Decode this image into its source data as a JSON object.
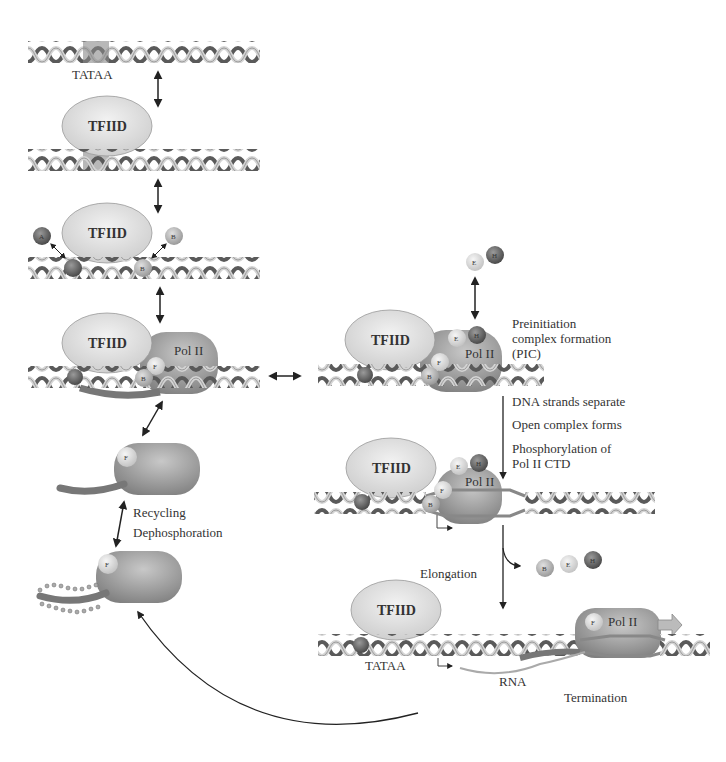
{
  "diagram": {
    "factors": {
      "tfiid": "TFIID",
      "pol2": "Pol II",
      "a": "A",
      "b": "B",
      "e": "E",
      "f": "F",
      "h": "H"
    },
    "labels": {
      "tataa": "TATAA",
      "pic_line1": "Preinitiation",
      "pic_line2": "complex formation",
      "pic_line3": "(PIC)",
      "dna_sep": "DNA strands separate",
      "open_complex": "Open complex forms",
      "phos_line1": "Phosphorylation of",
      "phos_line2": "Pol II CTD",
      "recycling": "Recycling",
      "dephos": "Dephosphoration",
      "elongation": "Elongation",
      "rna": "RNA",
      "termination": "Termination"
    },
    "colors": {
      "tfiid_fill": "#e2e2e2",
      "pol2_fill": "#9a9a9a",
      "dna_dark": "#555555",
      "dna_light": "#cfcfcf",
      "factor_dark": "#6e6e6e",
      "factor_light": "#d6d6d6",
      "arrow": "#222222"
    }
  }
}
